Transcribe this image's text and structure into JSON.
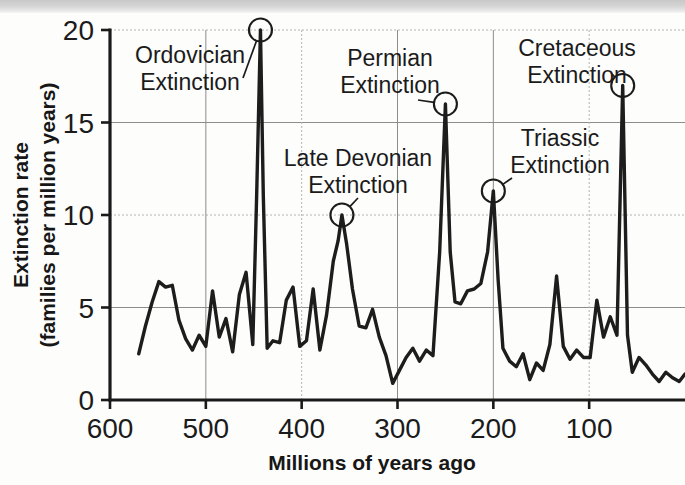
{
  "figure": {
    "background_color": "#fdfdfc",
    "ink_color": "#1d1d1d",
    "grid_color": "#8d8d8d"
  },
  "axes": {
    "y_title_line1": "Extinction rate",
    "y_title_line2": "(families per million years)",
    "x_title": "Millions of years ago",
    "y_ticks": [
      "0",
      "5",
      "10",
      "15",
      "20"
    ],
    "x_ticks": [
      "600",
      "500",
      "400",
      "300",
      "200",
      "100"
    ]
  },
  "annotations": [
    {
      "id": "ordovician",
      "line1": "Ordovician",
      "line2": "Extinction",
      "peak_x": 443,
      "peak_y": 20.0
    },
    {
      "id": "late-devonian",
      "line1": "Late Devonian",
      "line2": "Extinction",
      "peak_x": 358,
      "peak_y": 10.0
    },
    {
      "id": "permian",
      "line1": "Permian",
      "line2": "Extinction",
      "peak_x": 250,
      "peak_y": 16.0
    },
    {
      "id": "triassic",
      "line1": "Triassic",
      "line2": "Extinction",
      "peak_x": 200,
      "peak_y": 11.3
    },
    {
      "id": "cretaceous",
      "line1": "Cretaceous",
      "line2": "Extinction",
      "peak_x": 65,
      "peak_y": 17.0
    }
  ],
  "chart_data": {
    "type": "line",
    "title": "",
    "xlabel": "Millions of years ago",
    "ylabel": "Extinction rate (families per million years)",
    "xlim": [
      600,
      0
    ],
    "ylim": [
      0,
      20
    ],
    "x_inverted": true,
    "grid": true,
    "legend": null,
    "xticks": [
      600,
      500,
      400,
      300,
      200,
      100
    ],
    "yticks": [
      0,
      5,
      10,
      15,
      20
    ],
    "series": [
      {
        "name": "Extinction rate",
        "x": [
          570,
          563,
          556,
          549,
          542,
          535,
          528,
          521,
          514,
          507,
          500,
          493,
          486,
          479,
          472,
          465,
          458,
          451,
          447,
          443,
          440,
          436,
          430,
          423,
          416,
          409,
          402,
          395,
          388,
          381,
          374,
          367,
          362,
          358,
          353,
          347,
          340,
          333,
          326,
          319,
          312,
          305,
          298,
          291,
          284,
          277,
          270,
          263,
          256,
          250,
          245,
          240,
          234,
          227,
          220,
          213,
          206,
          200,
          195,
          190,
          183,
          176,
          169,
          162,
          155,
          148,
          141,
          134,
          127,
          120,
          113,
          106,
          99,
          92,
          85,
          78,
          71,
          65,
          60,
          55,
          48,
          41,
          34,
          27,
          20,
          13,
          6,
          0
        ],
        "y": [
          2.5,
          4.0,
          5.3,
          6.4,
          6.1,
          6.2,
          4.3,
          3.3,
          2.7,
          3.5,
          2.9,
          5.9,
          3.4,
          4.4,
          2.6,
          5.7,
          6.9,
          3.0,
          11.0,
          20.0,
          11.0,
          2.8,
          3.2,
          3.1,
          5.4,
          6.1,
          2.9,
          3.2,
          6.0,
          2.7,
          4.6,
          7.5,
          8.6,
          10.0,
          8.4,
          6.0,
          4.0,
          3.9,
          4.9,
          3.4,
          2.4,
          0.9,
          1.6,
          2.3,
          2.8,
          2.1,
          2.7,
          2.4,
          8.0,
          16.0,
          8.0,
          5.3,
          5.2,
          5.9,
          6.0,
          6.3,
          8.0,
          11.3,
          6.5,
          2.8,
          2.1,
          1.8,
          2.5,
          1.1,
          2.0,
          1.6,
          3.0,
          6.7,
          2.9,
          2.2,
          2.7,
          2.3,
          2.3,
          5.4,
          3.4,
          4.5,
          3.5,
          17.0,
          3.5,
          1.5,
          2.3,
          1.9,
          1.4,
          1.0,
          1.5,
          1.2,
          1.0,
          1.4
        ]
      }
    ],
    "marked_events": [
      {
        "label": "Ordovician Extinction",
        "x": 443,
        "y": 20.0
      },
      {
        "label": "Late Devonian Extinction",
        "x": 358,
        "y": 10.0
      },
      {
        "label": "Permian Extinction",
        "x": 250,
        "y": 16.0
      },
      {
        "label": "Triassic Extinction",
        "x": 200,
        "y": 11.3
      },
      {
        "label": "Cretaceous Extinction",
        "x": 65,
        "y": 17.0
      }
    ]
  }
}
